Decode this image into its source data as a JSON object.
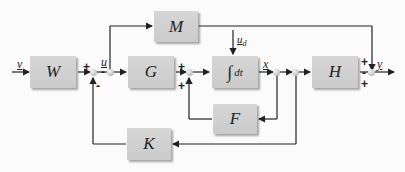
{
  "diagram": {
    "type": "control-system-block-diagram",
    "blocks": [
      {
        "id": "W",
        "label": "W"
      },
      {
        "id": "M",
        "label": "M"
      },
      {
        "id": "G",
        "label": "G"
      },
      {
        "id": "integrator",
        "label": "∫dt",
        "symbol": "∫",
        "suffix": "dt"
      },
      {
        "id": "F",
        "label": "F"
      },
      {
        "id": "H",
        "label": "H"
      },
      {
        "id": "K",
        "label": "K"
      }
    ],
    "signals": {
      "input": "v",
      "control": "u",
      "disturbance": "u",
      "disturbance_sub": "d",
      "state": "x",
      "output": "y"
    },
    "signs": {
      "sum1_top": "+",
      "sum1_bottom": "-",
      "sum1_right": "-",
      "sum2_top": "+",
      "sum2_bottom": "+",
      "sum_out_top": "+",
      "sum_out_mid": "-",
      "sum_out_bottom": "+"
    },
    "colors": {
      "block_fill": "#d0d0d0",
      "line": "#222222",
      "background": "#fbfbfb"
    }
  }
}
